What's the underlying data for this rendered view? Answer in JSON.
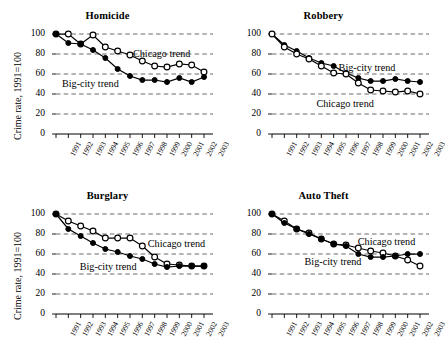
{
  "figure": {
    "ylabel": "Crime rate, 1991=100",
    "series_labels": {
      "chicago": "Chicago trend",
      "bigcity": "Big-city trend"
    }
  },
  "chart_data": [
    {
      "type": "line",
      "title": "Homicide",
      "xlabel": "",
      "ylabel": "Crime rate, 1991=100",
      "grid": true,
      "legend_position": "inline-annotation",
      "x": [
        1991,
        1992,
        1993,
        1994,
        1995,
        1996,
        1997,
        1998,
        1999,
        2000,
        2001,
        2002,
        2003
      ],
      "xlim": [
        1991,
        2003
      ],
      "ylim": [
        0,
        100
      ],
      "yticks": [
        0,
        20,
        40,
        60,
        80,
        100
      ],
      "xticks": [
        "1991",
        "1992",
        "1993",
        "1994",
        "1995",
        "1996",
        "1997",
        "1998",
        "1999",
        "2000",
        "2001",
        "2002",
        "2003"
      ],
      "series": [
        {
          "name": "Chicago trend",
          "marker": "open-circle",
          "values": [
            100,
            100,
            90,
            99,
            87,
            83,
            79,
            73,
            68,
            67,
            70,
            69,
            62
          ]
        },
        {
          "name": "Big-city trend",
          "marker": "filled-circle",
          "values": [
            100,
            91,
            90,
            84,
            76,
            65,
            58,
            54,
            54,
            52,
            56,
            52,
            57
          ]
        }
      ]
    },
    {
      "type": "line",
      "title": "Robbery",
      "xlabel": "",
      "ylabel": "Crime rate, 1991=100",
      "grid": true,
      "legend_position": "inline-annotation",
      "x": [
        1991,
        1992,
        1993,
        1994,
        1995,
        1996,
        1997,
        1998,
        1999,
        2000,
        2001,
        2002,
        2003
      ],
      "xlim": [
        1991,
        2003
      ],
      "ylim": [
        0,
        100
      ],
      "yticks": [
        0,
        20,
        40,
        60,
        80,
        100
      ],
      "xticks": [
        "1991",
        "1992",
        "1993",
        "1994",
        "1995",
        "1996",
        "1997",
        "1998",
        "1999",
        "2000",
        "2001",
        "2002",
        "2003"
      ],
      "series": [
        {
          "name": "Big-city trend",
          "marker": "filled-circle",
          "values": [
            100,
            89,
            83,
            76,
            71,
            68,
            61,
            56,
            53,
            53,
            55,
            53,
            52
          ]
        },
        {
          "name": "Chicago trend",
          "marker": "open-circle",
          "values": [
            100,
            87,
            80,
            75,
            68,
            61,
            60,
            51,
            44,
            43,
            42,
            43,
            40
          ]
        }
      ]
    },
    {
      "type": "line",
      "title": "Burglary",
      "xlabel": "",
      "ylabel": "Crime rate, 1991=100",
      "grid": true,
      "legend_position": "inline-annotation",
      "x": [
        1991,
        1992,
        1993,
        1994,
        1995,
        1996,
        1997,
        1998,
        1999,
        2000,
        2001,
        2002,
        2003
      ],
      "xlim": [
        1991,
        2003
      ],
      "ylim": [
        0,
        100
      ],
      "yticks": [
        0,
        20,
        40,
        60,
        80,
        100
      ],
      "xticks": [
        "1991",
        "1992",
        "1993",
        "1994",
        "1995",
        "1996",
        "1997",
        "1998",
        "1999",
        "2000",
        "2001",
        "2002",
        "2003"
      ],
      "series": [
        {
          "name": "Chicago trend",
          "marker": "open-circle",
          "values": [
            100,
            93,
            88,
            83,
            76,
            76,
            76,
            68,
            57,
            50,
            49,
            48,
            48
          ]
        },
        {
          "name": "Big-city trend",
          "marker": "filled-circle",
          "values": [
            100,
            85,
            78,
            71,
            65,
            62,
            58,
            55,
            50,
            47,
            48,
            48,
            48
          ]
        }
      ]
    },
    {
      "type": "line",
      "title": "Auto Theft",
      "xlabel": "",
      "ylabel": "Crime rate, 1991=100",
      "grid": true,
      "legend_position": "inline-annotation",
      "x": [
        1991,
        1992,
        1993,
        1994,
        1995,
        1996,
        1997,
        1998,
        1999,
        2000,
        2001,
        2002,
        2003
      ],
      "xlim": [
        1991,
        2003
      ],
      "ylim": [
        0,
        100
      ],
      "yticks": [
        0,
        20,
        40,
        60,
        80,
        100
      ],
      "xticks": [
        "1991",
        "1992",
        "1993",
        "1994",
        "1995",
        "1996",
        "1997",
        "1998",
        "1999",
        "2000",
        "2001",
        "2002",
        "2003"
      ],
      "series": [
        {
          "name": "Chicago trend",
          "marker": "open-circle",
          "values": [
            100,
            93,
            85,
            81,
            75,
            70,
            69,
            66,
            63,
            61,
            58,
            54,
            48
          ]
        },
        {
          "name": "Big-city trend",
          "marker": "filled-circle",
          "values": [
            100,
            91,
            85,
            80,
            75,
            70,
            68,
            60,
            57,
            57,
            58,
            60,
            60
          ]
        }
      ]
    }
  ],
  "panel_annotations": [
    {
      "chicago": {
        "x": 0.52,
        "y": 0.8
      },
      "bigcity": {
        "x": 0.04,
        "y": 0.5
      }
    },
    {
      "chicago": {
        "x": 0.3,
        "y": 0.3
      },
      "bigcity": {
        "x": 0.45,
        "y": 0.66
      }
    },
    {
      "chicago": {
        "x": 0.62,
        "y": 0.7
      },
      "bigcity": {
        "x": 0.16,
        "y": 0.47
      }
    },
    {
      "chicago": {
        "x": 0.58,
        "y": 0.72
      },
      "bigcity": {
        "x": 0.22,
        "y": 0.52
      }
    }
  ]
}
